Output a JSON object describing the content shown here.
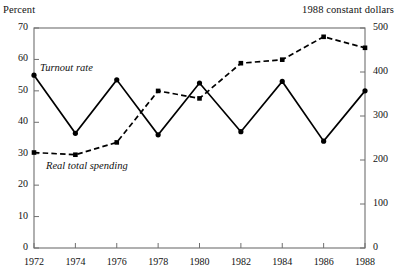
{
  "axis_captions": {
    "left": "Percent",
    "right": "1988 constant dollars"
  },
  "series_labels": {
    "turnout": "Turnout rate",
    "spending": "Real total spending"
  },
  "colors": {
    "line": "#000000",
    "frame": "#6f6f6f",
    "text": "#111111",
    "background": "#ffffff"
  },
  "chart_data": {
    "type": "line",
    "title": "",
    "subtitle": "",
    "xlabel": "",
    "ylabel": "Percent",
    "y2label": "1988 constant dollars",
    "grid": false,
    "legend": "inline-annotations",
    "x": [
      1972,
      1974,
      1976,
      1978,
      1980,
      1982,
      1984,
      1986,
      1988
    ],
    "xticklabels": [
      "1972",
      "1974",
      "1976",
      "1978",
      "1980",
      "1982",
      "1984",
      "1986",
      "1988"
    ],
    "ylim": [
      0,
      70
    ],
    "yticks": [
      0,
      10,
      20,
      30,
      40,
      50,
      60,
      70
    ],
    "yticklabels": [
      "0",
      "10",
      "20",
      "30",
      "40",
      "50",
      "60",
      "70"
    ],
    "y2lim": [
      0,
      500
    ],
    "y2ticks": [
      0,
      100,
      200,
      300,
      400,
      500
    ],
    "y2ticklabels": [
      "0",
      "100",
      "200",
      "300",
      "400",
      "500"
    ],
    "series": [
      {
        "name": "Turnout rate",
        "axis": "left",
        "style": "solid",
        "marker": "filled-circle",
        "values": [
          55.0,
          36.5,
          53.5,
          36.0,
          52.5,
          37.0,
          53.0,
          34.0,
          50.0
        ]
      },
      {
        "name": "Real total spending",
        "axis": "right",
        "style": "dashed",
        "marker": "filled-square",
        "values": [
          217,
          212,
          240,
          357,
          340,
          420,
          428,
          480,
          455
        ]
      }
    ]
  }
}
